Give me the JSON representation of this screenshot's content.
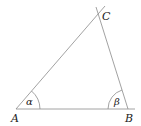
{
  "figure": {
    "type": "triangle",
    "vertices": [
      {
        "label": "A",
        "x": 16,
        "y": 109
      },
      {
        "label": "B",
        "x": 128,
        "y": 109
      },
      {
        "label": "C",
        "x": 99,
        "y": 17
      }
    ],
    "angles": [
      {
        "vertex": "A",
        "label": "α"
      },
      {
        "vertex": "B",
        "label": "β"
      }
    ],
    "line_color": "#888888",
    "text_color": "#222222"
  }
}
